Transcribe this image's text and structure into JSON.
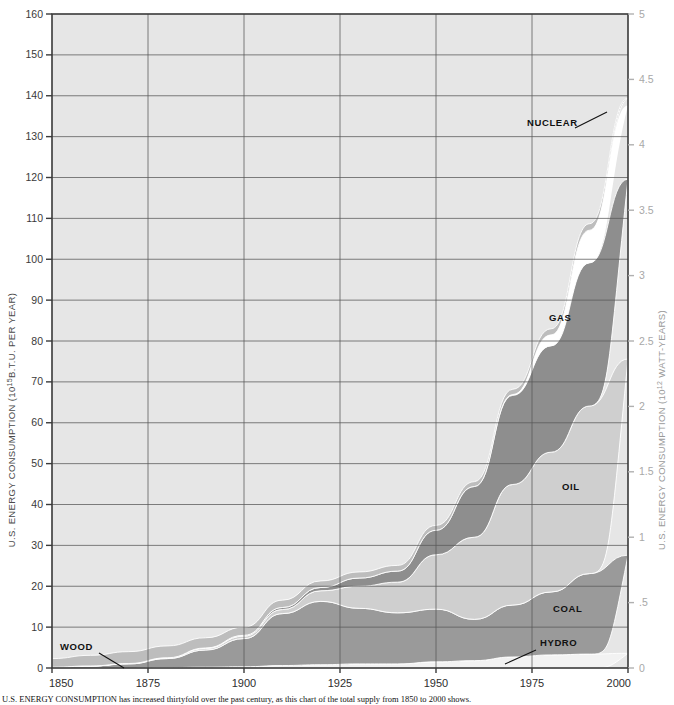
{
  "figure": {
    "caption": "U.S. ENERGY CONSUMPTION has increased thirtyfold over the past century, as this chart of the total supply from 1850 to 2000 shows."
  },
  "axes": {
    "left": {
      "title": "U.S. ENERGY CONSUMPTION (10",
      "title_sup": "15",
      "title_tail": "B.T.U. PER YEAR)",
      "ticks": [
        "0",
        "10",
        "20",
        "30",
        "40",
        "50",
        "60",
        "70",
        "80",
        "90",
        "100",
        "110",
        "120",
        "130",
        "140",
        "150",
        "160"
      ],
      "min": 0,
      "max": 160
    },
    "right": {
      "title": "U.S. ENERGY CONSUMPTION (10",
      "title_sup": "12",
      "title_tail": " WATT-YEARS)",
      "ticks": [
        "0",
        ".5",
        "1",
        "1.5",
        "2",
        "2.5",
        "3",
        "3.5",
        "4",
        "4.5",
        "5"
      ],
      "min": 0,
      "max": 5
    },
    "bottom": {
      "ticks": [
        "1850",
        "1875",
        "1900",
        "1925",
        "1950",
        "1975",
        "2000"
      ],
      "min": 1850,
      "max": 2000
    }
  },
  "colors": {
    "plot_background": "#e6e6e6",
    "wood": "#bdbdbd",
    "hydro": "#f2f2f2",
    "coal": "#9a9a9a",
    "oil": "#cfcfcf",
    "gas": "#8e8e8e",
    "nuclear": "#ffffff",
    "grid": "#5a5a5a",
    "frame": "#3a3a3a"
  },
  "series_labels": [
    {
      "name": "NUCLEAR",
      "x": 527,
      "y": 126,
      "leader": "M575,128 L607,112"
    },
    {
      "name": "GAS",
      "x": 549,
      "y": 321,
      "leader": ""
    },
    {
      "name": "OIL",
      "x": 562,
      "y": 490,
      "leader": ""
    },
    {
      "name": "COAL",
      "x": 553,
      "y": 612,
      "leader": ""
    },
    {
      "name": "HYDRO",
      "x": 540,
      "y": 646,
      "leader": "M536,650 L505,664"
    },
    {
      "name": "WOOD",
      "x": 60,
      "y": 650,
      "leader": "M99,653 L124,668"
    }
  ],
  "chart_data": {
    "type": "area",
    "xlabel": "",
    "ylabel": "U.S. ENERGY CONSUMPTION (10^15 B.T.U. PER YEAR)",
    "ylabel_right": "U.S. ENERGY CONSUMPTION (10^12 WATT-YEARS)",
    "xlim": [
      1850,
      2000
    ],
    "ylim": [
      0,
      160
    ],
    "ylim_right": [
      0,
      5
    ],
    "grid": true,
    "legend": "inline-labels",
    "stacking_order": [
      "HYDRO",
      "COAL",
      "OIL",
      "GAS",
      "NUCLEAR",
      "WOOD"
    ],
    "x": [
      1850,
      1860,
      1870,
      1880,
      1890,
      1900,
      1910,
      1920,
      1930,
      1940,
      1950,
      1960,
      1970,
      1980,
      1990,
      2000
    ],
    "series": [
      {
        "name": "HYDRO",
        "color": "#f2f2f2",
        "values": [
          0.0,
          0.0,
          0.0,
          0.1,
          0.2,
          0.3,
          0.6,
          0.8,
          1.0,
          1.0,
          1.5,
          1.8,
          2.7,
          3.2,
          3.4,
          3.6
        ]
      },
      {
        "name": "COAL",
        "color": "#9a9a9a",
        "values": [
          0.2,
          0.5,
          1.0,
          2.2,
          4.2,
          6.9,
          12.7,
          15.5,
          13.6,
          12.5,
          12.9,
          10.1,
          12.7,
          15.4,
          19.7,
          24.0
        ]
      },
      {
        "name": "OIL",
        "color": "#cfcfcf",
        "values": [
          0.0,
          0.0,
          0.1,
          0.2,
          0.4,
          0.6,
          1.0,
          2.6,
          5.4,
          7.5,
          13.3,
          20.1,
          29.5,
          34.2,
          41.0,
          48.0
        ]
      },
      {
        "name": "GAS",
        "color": "#8e8e8e",
        "values": [
          0.0,
          0.0,
          0.0,
          0.0,
          0.1,
          0.2,
          0.5,
          0.8,
          2.0,
          2.7,
          6.0,
          12.4,
          21.8,
          26.0,
          35.0,
          44.0
        ]
      },
      {
        "name": "NUCLEAR",
        "color": "#ffffff",
        "values": [
          0.0,
          0.0,
          0.0,
          0.0,
          0.0,
          0.0,
          0.0,
          0.0,
          0.0,
          0.0,
          0.0,
          0.0,
          0.2,
          2.7,
          8.0,
          18.0
        ]
      },
      {
        "name": "WOOD",
        "color": "#bdbdbd",
        "values": [
          2.1,
          2.6,
          2.9,
          2.9,
          2.5,
          2.0,
          1.8,
          1.6,
          1.5,
          1.4,
          1.2,
          1.2,
          1.3,
          1.5,
          1.6,
          1.8
        ]
      }
    ],
    "totals": [
      2.3,
      3.1,
      4.0,
      5.4,
      7.4,
      10.0,
      16.6,
      21.3,
      23.5,
      25.1,
      34.9,
      45.6,
      68.2,
      83.0,
      108.7,
      139.4
    ],
    "annotations": [
      "NUCLEAR",
      "GAS",
      "OIL",
      "COAL",
      "HYDRO",
      "WOOD"
    ]
  }
}
